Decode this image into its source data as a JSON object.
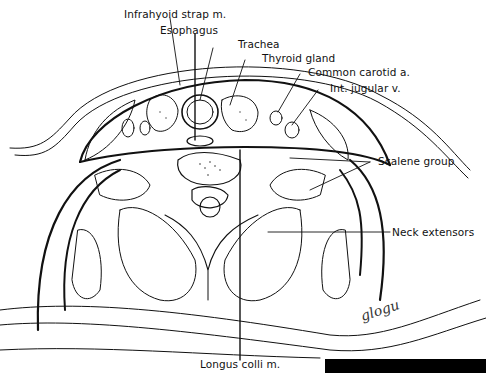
{
  "diagram": {
    "labels": {
      "infrahyoid": "Infrahyoid strap m.",
      "esophagus": "Esophagus",
      "trachea": "Trachea",
      "thyroid": "Thyroid gland",
      "carotid": "Common carotid a.",
      "jugular": "Int. jugular v.",
      "scalene": "Scalene group",
      "extensors": "Neck extensors",
      "longus": "Longus colli m."
    },
    "signature": "glogu",
    "colors": {
      "ink": "#111111",
      "background": "#ffffff",
      "bar": "#000000"
    }
  }
}
